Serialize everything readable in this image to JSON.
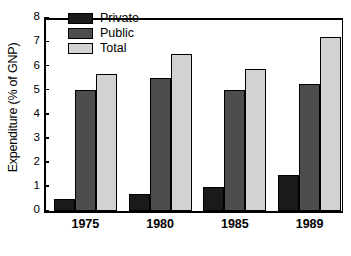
{
  "chart_data": {
    "type": "bar",
    "title": "",
    "xlabel": "",
    "ylabel": "Expenditure (% of GNP)",
    "categories": [
      "1975",
      "1980",
      "1985",
      "1989"
    ],
    "series": [
      {
        "name": "Private",
        "color": "#1a1a1a",
        "values": [
          0.5,
          0.7,
          1.0,
          1.5
        ]
      },
      {
        "name": "Public",
        "color": "#4d4d4d",
        "values": [
          5.0,
          5.5,
          5.0,
          5.25
        ]
      },
      {
        "name": "Total",
        "color": "#d2d2d2",
        "values": [
          5.7,
          6.5,
          5.9,
          7.2
        ]
      }
    ],
    "ylim": [
      0,
      8
    ],
    "yticks": [
      0,
      1,
      2,
      3,
      4,
      5,
      6,
      7,
      8
    ],
    "ytick_labels": [
      "0",
      "1",
      "2",
      "3",
      "4",
      "5",
      "6",
      "7",
      "8"
    ],
    "grid": false,
    "legend_position": "top-left",
    "legend_entries": [
      "Private",
      "Public",
      "Total"
    ]
  }
}
